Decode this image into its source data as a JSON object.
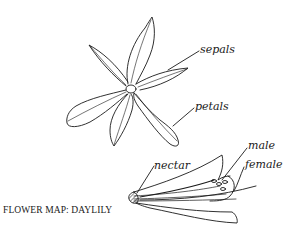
{
  "diagram": {
    "title": "FLOWER MAP: DAYLILY",
    "colors": {
      "ink": "#1a1a1a",
      "background": "#ffffff"
    },
    "top_view": {
      "labels": [
        {
          "id": "sepals",
          "text": "sepals",
          "x": 200,
          "y": 44,
          "target": [
            168,
            70
          ]
        },
        {
          "id": "petals",
          "text": "petals",
          "x": 195,
          "y": 101,
          "target": [
            172,
            126
          ]
        }
      ]
    },
    "side_view": {
      "labels": [
        {
          "id": "nectar",
          "text": "nectar",
          "x": 154,
          "y": 160,
          "target": [
            136,
            194
          ]
        },
        {
          "id": "male",
          "text": "male",
          "x": 248,
          "y": 140,
          "target": [
            222,
            180
          ]
        },
        {
          "id": "female",
          "text": "female",
          "x": 245,
          "y": 159,
          "target": [
            234,
            190
          ]
        }
      ]
    }
  }
}
